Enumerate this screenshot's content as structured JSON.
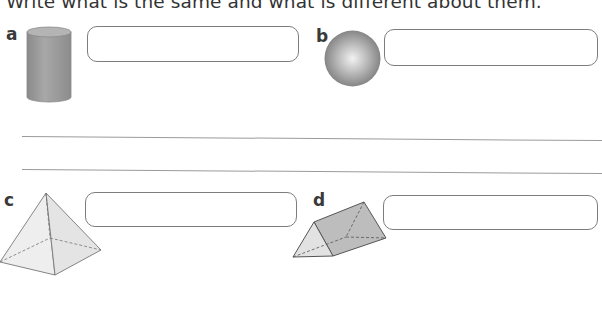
{
  "instruction": "Write what is the same and what is different about them.",
  "items": [
    {
      "label": "a",
      "shape": "cylinder",
      "answer": ""
    },
    {
      "label": "b",
      "shape": "sphere",
      "answer": ""
    },
    {
      "label": "c",
      "shape": "square-based pyramid",
      "answer": ""
    },
    {
      "label": "d",
      "shape": "triangular prism",
      "answer": ""
    }
  ],
  "writing_lines": [
    "",
    ""
  ],
  "colors": {
    "box_border": "#7d7d7d",
    "shape_grey": "#9e9e9e",
    "line": "#9a9a9a"
  }
}
